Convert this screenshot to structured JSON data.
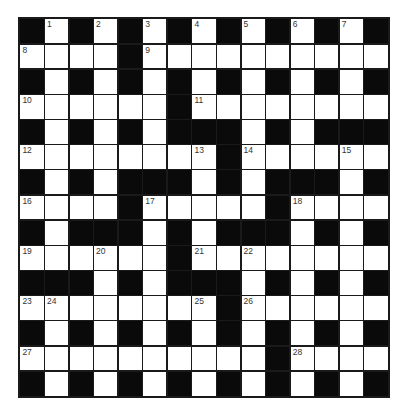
{
  "puzzle": {
    "rows": 15,
    "cols": 15,
    "grid": [
      "#.#.#.#.#.#.#.#",
      "....#..........",
      "#.#.#.#.#.#.#.#",
      "......#........",
      "#.#.#.###.#.###",
      "........#......",
      "#.#.###.#.###.#",
      "....#.....#....",
      "#.###.#.###.#.#",
      "......#........",
      "###.#.###.#.#.#",
      "........#......",
      "#.#.#.#.#.#.#.#",
      "..........#....",
      "#.#.#.#.#.#.#.#"
    ],
    "numbers": [
      {
        "r": 0,
        "c": 1,
        "n": "1"
      },
      {
        "r": 0,
        "c": 3,
        "n": "2"
      },
      {
        "r": 0,
        "c": 5,
        "n": "3"
      },
      {
        "r": 0,
        "c": 7,
        "n": "4"
      },
      {
        "r": 0,
        "c": 9,
        "n": "5"
      },
      {
        "r": 0,
        "c": 11,
        "n": "6"
      },
      {
        "r": 0,
        "c": 13,
        "n": "7"
      },
      {
        "r": 1,
        "c": 0,
        "n": "8"
      },
      {
        "r": 1,
        "c": 5,
        "n": "9"
      },
      {
        "r": 3,
        "c": 0,
        "n": "10"
      },
      {
        "r": 3,
        "c": 7,
        "n": "11"
      },
      {
        "r": 5,
        "c": 0,
        "n": "12"
      },
      {
        "r": 5,
        "c": 7,
        "n": "13"
      },
      {
        "r": 5,
        "c": 9,
        "n": "14"
      },
      {
        "r": 5,
        "c": 13,
        "n": "15"
      },
      {
        "r": 7,
        "c": 0,
        "n": "16"
      },
      {
        "r": 7,
        "c": 5,
        "n": "17"
      },
      {
        "r": 7,
        "c": 11,
        "n": "18"
      },
      {
        "r": 9,
        "c": 0,
        "n": "19"
      },
      {
        "r": 9,
        "c": 3,
        "n": "20"
      },
      {
        "r": 9,
        "c": 7,
        "n": "21"
      },
      {
        "r": 9,
        "c": 9,
        "n": "22"
      },
      {
        "r": 11,
        "c": 0,
        "n": "23"
      },
      {
        "r": 11,
        "c": 1,
        "n": "24"
      },
      {
        "r": 11,
        "c": 7,
        "n": "25"
      },
      {
        "r": 11,
        "c": 9,
        "n": "26"
      },
      {
        "r": 13,
        "c": 0,
        "n": "27"
      },
      {
        "r": 13,
        "c": 11,
        "n": "28"
      }
    ],
    "colors": {
      "block": "#0a0a0a",
      "cell": "#ffffff",
      "grid_line": "#1a1a1a",
      "number": "#333333"
    }
  }
}
